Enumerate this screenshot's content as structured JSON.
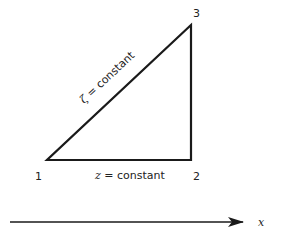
{
  "diagram": {
    "vertices": [
      {
        "id": "1",
        "label": "1",
        "x": 47,
        "y": 160
      },
      {
        "id": "2",
        "label": "2",
        "x": 191,
        "y": 160
      },
      {
        "id": "3",
        "label": "3",
        "x": 191,
        "y": 25
      }
    ],
    "edges": {
      "hypotenuse_label_symbol": "ζ",
      "hypotenuse_label_text": " = constant",
      "base_label_symbol": "z",
      "base_label_text": " = constant"
    },
    "axis": {
      "label": "x"
    },
    "colors": {
      "stroke": "#1a1a1a",
      "text": "#222222",
      "background": "#ffffff"
    }
  }
}
